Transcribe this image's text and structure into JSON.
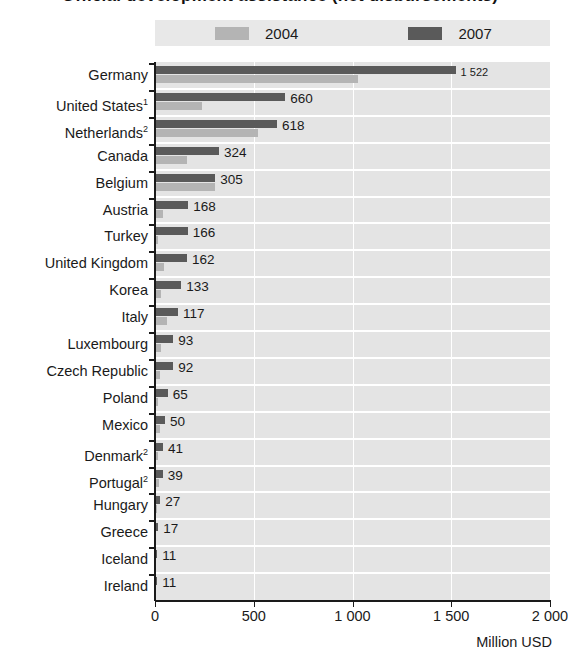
{
  "chart_data": {
    "type": "bar",
    "orientation": "horizontal",
    "title": "Official development assistance (net disbursements)",
    "xlabel": "Million USD",
    "ylabel": "",
    "xlim": [
      0,
      2000
    ],
    "xticks": [
      0,
      500,
      1000,
      1500,
      2000
    ],
    "xtick_labels": [
      "0",
      "500",
      "1 000",
      "1 500",
      "2 000"
    ],
    "grid": true,
    "legend_position": "top",
    "categories": [
      "Germany",
      "United States",
      "Netherlands",
      "Canada",
      "Belgium",
      "Austria",
      "Turkey",
      "United Kingdom",
      "Korea",
      "Italy",
      "Luxembourg",
      "Czech Republic",
      "Poland",
      "Mexico",
      "Denmark",
      "Portugal",
      "Hungary",
      "Greece",
      "Iceland",
      "Ireland"
    ],
    "category_footnotes": [
      "",
      "1",
      "2",
      "",
      "",
      "",
      "",
      "",
      "",
      "",
      "",
      "",
      "",
      "",
      "2",
      "2",
      "",
      "",
      "",
      ""
    ],
    "series": [
      {
        "name": "2004",
        "color": "#b4b4b4",
        "values": [
          1030,
          240,
          520,
          160,
          305,
          38,
          15,
          45,
          28,
          60,
          32,
          24,
          14,
          25,
          14,
          20,
          10,
          4,
          3,
          3
        ]
      },
      {
        "name": "2007",
        "color": "#5a5a5a",
        "values": [
          1522,
          660,
          618,
          324,
          305,
          168,
          166,
          162,
          133,
          117,
          93,
          92,
          65,
          50,
          41,
          39,
          27,
          17,
          11,
          11
        ]
      }
    ],
    "value_labels": [
      "1 522",
      "660",
      "618",
      "324",
      "305",
      "168",
      "166",
      "162",
      "133",
      "117",
      "93",
      "92",
      "65",
      "50",
      "41",
      "39",
      "27",
      "17",
      "11",
      "11"
    ]
  },
  "legend": {
    "items": [
      {
        "label": "2004",
        "color": "#b4b4b4"
      },
      {
        "label": "2007",
        "color": "#5a5a5a"
      }
    ]
  },
  "axis": {
    "x_title": "Million USD"
  }
}
